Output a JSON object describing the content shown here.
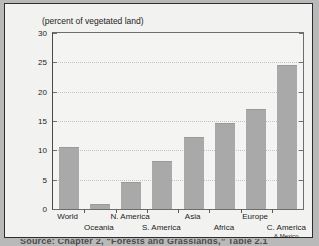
{
  "figure": {
    "title": "(percent of vegetated land)",
    "caption": "Source: Chapter 2, “Forests and Grasslands,” Table 2.1"
  },
  "chart_data": {
    "type": "bar",
    "title": "(percent of vegetated land)",
    "xlabel": "",
    "ylabel": "",
    "ylim": [
      0,
      30
    ],
    "yticks": [
      0,
      5,
      10,
      15,
      20,
      25,
      30
    ],
    "grid": true,
    "legend": false,
    "bar_color": "#a9a9a9",
    "categories": [
      "World",
      "Oceania",
      "N. America",
      "S. America",
      "Asia",
      "Africa",
      "Europe",
      "C. America & Mexico"
    ],
    "values": [
      10.6,
      0.9,
      4.6,
      8.2,
      12.2,
      14.6,
      17.1,
      24.5
    ],
    "tick_labels": [
      {
        "text": "World",
        "row": 0
      },
      {
        "text": "Oceania",
        "row": 1
      },
      {
        "text": "N. America",
        "row": 0
      },
      {
        "text": "S. America",
        "row": 1
      },
      {
        "text": "Asia",
        "row": 0
      },
      {
        "text": "Africa",
        "row": 1
      },
      {
        "text": "Europe",
        "row": 0
      },
      {
        "text": "C. America",
        "row": 1,
        "text2": "& Mexico"
      }
    ]
  }
}
